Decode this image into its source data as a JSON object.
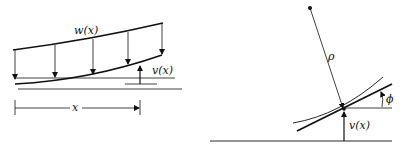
{
  "left_panel": {
    "load_label": "w(x)",
    "deflection_label": "v(x)",
    "position_label": "x"
  },
  "right_panel": {
    "radius_label": "ρ",
    "angle_label": "ϕ",
    "deflection_label": "v(x)"
  },
  "colors": {
    "stroke": "#111111",
    "background": "#ffffff"
  }
}
